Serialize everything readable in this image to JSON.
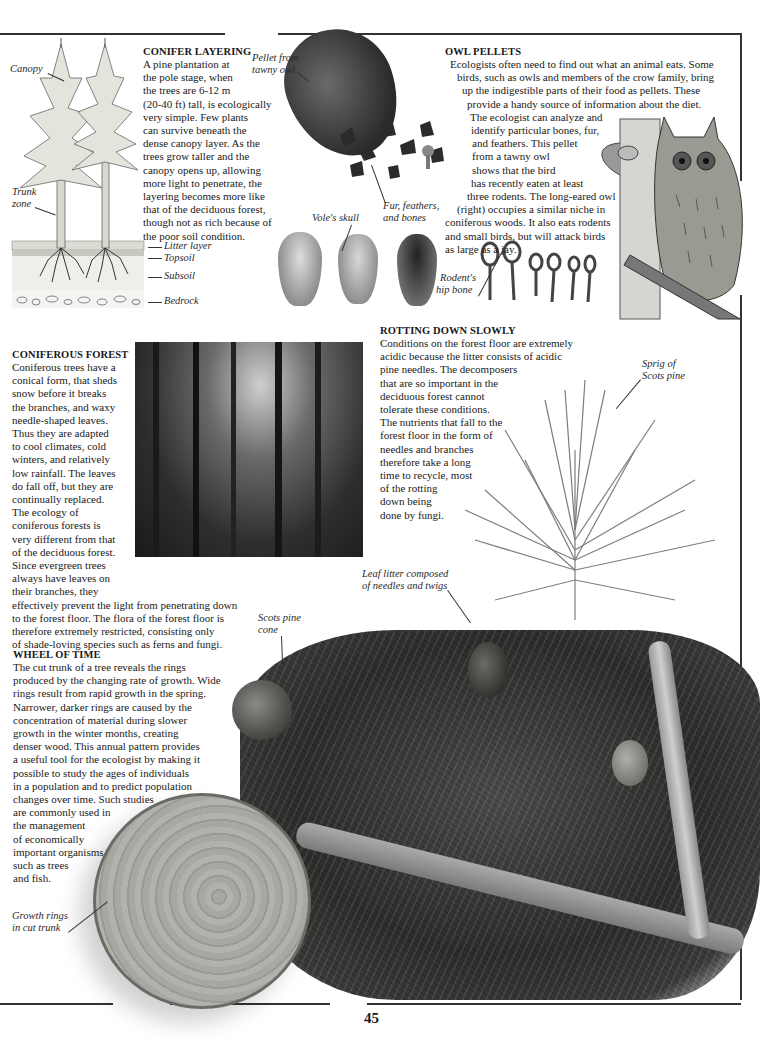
{
  "page": {
    "number": "45"
  },
  "conifer_layering": {
    "heading": "CONIFER LAYERING",
    "lines": [
      "A pine plantation at",
      "the pole stage, when",
      "the trees are 6-12 m",
      "(20-40 ft) tall, is ecologically",
      "very simple. Few plants",
      "can survive beneath the",
      "dense canopy layer. As the",
      "trees grow taller and the",
      "canopy opens up, allowing",
      "more light to penetrate, the",
      "layering becomes more like",
      "that of the deciduous forest,",
      "though not as rich because of",
      "the poor soil condition."
    ],
    "diagram_labels": {
      "canopy": "Canopy",
      "trunk_zone_1": "Trunk",
      "trunk_zone_2": "zone",
      "litter": "Litter layer",
      "topsoil": "Topsoil",
      "subsoil": "Subsoil",
      "bedrock": "Bedrock"
    }
  },
  "owl_pellets": {
    "heading": "OWL PELLETS",
    "lines": [
      "Ecologists often need to find out what an animal eats. Some",
      "birds, such as owls and members of the crow family, bring",
      "up the indigestible parts of their food as pellets. These",
      "provide a handy source of information about the diet.",
      "The ecologist can analyze and",
      "identify particular bones, fur,",
      "and feathers. This pellet",
      "from a tawny owl",
      "shows that the bird",
      "has recently eaten at least",
      "three rodents. The long-eared owl",
      "(right) occupies a similar niche in",
      "coniferous woods. It also eats rodents",
      "and small birds, but will attack birds",
      "as large as a jay."
    ],
    "captions": {
      "pellet_1": "Pellet from",
      "pellet_2": "tawny owl",
      "fur_1": "Fur, feathers,",
      "fur_2": "and bones",
      "vole": "Vole's skull",
      "hip_1": "Rodent's",
      "hip_2": "hip bone"
    }
  },
  "coniferous_forest": {
    "heading": "CONIFEROUS FOREST",
    "lines": [
      "Coniferous trees have a",
      "conical form, that sheds",
      "snow before it breaks",
      "the branches, and waxy",
      "needle-shaped leaves.",
      "Thus they are adapted",
      "to cool climates, cold",
      "winters, and relatively",
      "low rainfall. The leaves",
      "do fall off, but they are",
      "continually replaced.",
      "The ecology of",
      "coniferous forests is",
      "very different from that",
      "of the deciduous forest.",
      "Since evergreen trees",
      "always have leaves on",
      "their branches, they",
      "effectively prevent the light from penetrating down",
      "to the forest floor. The flora of the forest floor is",
      "therefore extremely restricted, consisting only",
      "of shade-loving species such as ferns and fungi."
    ]
  },
  "rotting": {
    "heading": "ROTTING DOWN SLOWLY",
    "lines": [
      "Conditions on the forest floor are extremely",
      "acidic because the litter consists of acidic",
      "pine needles. The decomposers",
      "that are so important in the",
      "deciduous forest cannot",
      "tolerate these conditions.",
      "The nutrients that fall to the",
      "forest floor in the form of",
      "needles and branches",
      "therefore take a long",
      "time to recycle, most",
      "of the rotting",
      "down being",
      "done by fungi."
    ],
    "captions": {
      "sprig_1": "Sprig of",
      "sprig_2": "Scots pine",
      "litter_1": "Leaf litter composed",
      "litter_2": "of needles and twigs",
      "cone_1": "Scots pine",
      "cone_2": "cone"
    }
  },
  "wheel_of_time": {
    "heading": "WHEEL OF TIME",
    "lines": [
      "The cut trunk of a tree reveals the rings",
      "produced by the changing rate of growth. Wide",
      "rings result from rapid growth in the spring.",
      "Narrower, darker rings are caused by the",
      "concentration of material during slower",
      "growth in the winter months, creating",
      "denser wood. This annual pattern provides",
      "a useful tool for the ecologist by making it",
      "possible to study the ages of individuals",
      "in a population and to predict population",
      "changes over time. Such studies",
      "are commonly used in",
      "the management",
      "of economically",
      "important organisms",
      "such as trees",
      "and fish."
    ],
    "captions": {
      "rings_1": "Growth rings",
      "rings_2": "in cut trunk"
    }
  }
}
